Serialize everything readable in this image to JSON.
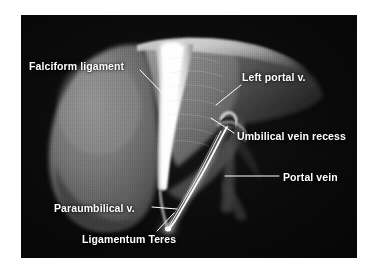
{
  "figure": {
    "modality_look": "grayscale volume-rendered CT",
    "background_color": "#0a0a0a",
    "label_color": "#ffffff",
    "page_color": "#ffffff",
    "panel": {
      "x": 21,
      "y": 15,
      "width": 336,
      "height": 243
    }
  },
  "labels": {
    "falciform_ligament": "Falciform ligament",
    "left_portal_v": "Left portal v.",
    "umbilical_vein_recess": "Umbilical vein recess",
    "portal_vein": "Portal vein",
    "paraumbilical_v": "Paraumbilical v.",
    "ligamentum_teres": "Ligamentum Teres"
  },
  "structures": [
    {
      "name": "left-hepatic-lobe",
      "description": "large gray lobe occupying left half of the field",
      "tone": "#6e6e6e"
    },
    {
      "name": "falciform-ligament-ridge",
      "description": "bright white vertical band dividing the lobes",
      "tone": "#f2f2f2"
    },
    {
      "name": "right-hepatic-lobe",
      "description": "mid-gray lobe sweeping to the upper right",
      "tone": "#5a5a5a"
    },
    {
      "name": "umbilical-vein-recess",
      "description": "small hook-shaped notch at the portal hilum",
      "tone": "#dcdcdc"
    },
    {
      "name": "ligamentum-teres-cord",
      "description": "bright curved cord running to the inferior tip",
      "tone": "#ffffff"
    },
    {
      "name": "paraumbilical-vein",
      "description": "thin bright vessel parallel to the ligamentum teres",
      "tone": "#f0f0f0"
    },
    {
      "name": "portal-vein-trunk",
      "description": "faint vertical gray vessel below the hilum",
      "tone": "#4a4a4a"
    }
  ],
  "leader_lines": [
    {
      "name": "falciform-leader",
      "from": [
        140,
        70
      ],
      "to": [
        170,
        100
      ],
      "style": "diagonal"
    },
    {
      "name": "left-portal-leader",
      "from": [
        243,
        84
      ],
      "to": [
        216,
        104
      ],
      "style": "diagonal"
    },
    {
      "name": "umbilical-leader",
      "from": [
        234,
        131
      ],
      "to": [
        210,
        117
      ],
      "style": "diagonal"
    },
    {
      "name": "portal-vein-leader",
      "from": [
        225,
        176
      ],
      "to": [
        279,
        176
      ],
      "style": "horizontal"
    },
    {
      "name": "paraumbilical-leader",
      "from": [
        153,
        207
      ],
      "to": [
        176,
        210
      ],
      "style": "horizontal"
    },
    {
      "name": "ligamentum-leader",
      "from": [
        156,
        231
      ],
      "to": [
        175,
        214
      ],
      "style": "diagonal"
    }
  ]
}
